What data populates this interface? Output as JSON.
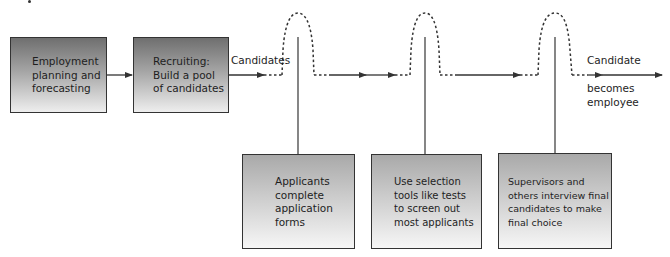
{
  "diagram": {
    "type": "process-flow",
    "steps": [
      {
        "id": "planning",
        "text": "Employment\nplanning and\nforecasting"
      },
      {
        "id": "recruiting",
        "text": "Recruiting:\nBuild a pool\nof candidates"
      }
    ],
    "screens": [
      {
        "id": "screen-1",
        "text": "Applicants\ncomplete\napplication\nforms"
      },
      {
        "id": "screen-2",
        "text": "Use selection\ntools like tests\nto screen out\nmost applicants"
      },
      {
        "id": "screen-3",
        "text": "Supervisors and\nothers interview final\ncandidates to make\nfinal choice"
      }
    ],
    "labels": {
      "candidates": "Candidates",
      "outcome_top": "Candidate",
      "outcome_bottom": "becomes\nemployee"
    },
    "colors": {
      "line": "#333333",
      "top_box_gradient": [
        "#6f6f6f",
        "#eeeeee"
      ],
      "bottom_box_gradient": [
        "#a9a9a9",
        "#f6f6f6"
      ]
    }
  }
}
